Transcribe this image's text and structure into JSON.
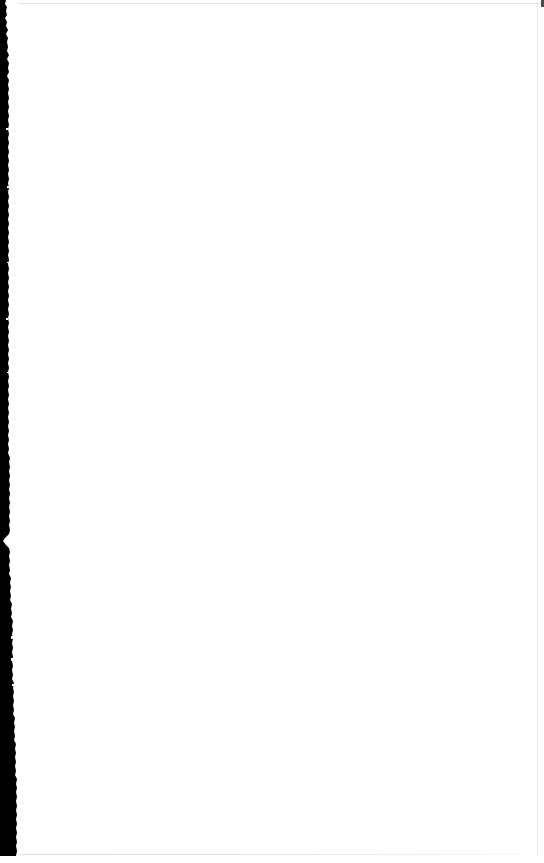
{
  "document": {
    "kind": "scanned-page",
    "page_content": "",
    "page_state_label": "blank",
    "width_px": 544,
    "height_px": 863
  },
  "colors": {
    "paper": "#ffffff",
    "gutter_shadow": "#000000",
    "edge_rule": "#e4e4e4",
    "corner_speck": "#4a4a4a"
  },
  "artifacts": {
    "gutter": {
      "name": "left-binding-shadow",
      "edge": "left",
      "top_px": 0,
      "bottom_px": 856,
      "min_width_px": 5,
      "max_width_px": 17
    },
    "rules": [
      {
        "name": "top-edge-rule",
        "edge": "top"
      },
      {
        "name": "right-edge-rule",
        "edge": "right"
      },
      {
        "name": "bottom-edge-rule",
        "edge": "bottom"
      }
    ],
    "speck": {
      "name": "top-right-corner-speck"
    }
  }
}
